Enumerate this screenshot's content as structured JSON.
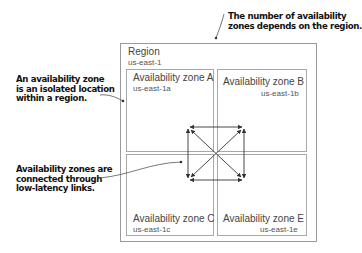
{
  "callouts": {
    "top_right": {
      "lines": [
        "The number of availability",
        "zones depends on the region."
      ]
    },
    "left_top": {
      "lines": [
        "An availability zone",
        "is an isolated location",
        "within a region."
      ]
    },
    "left_bottom": {
      "lines": [
        "Availability zones are",
        "connected through",
        "low-latency links."
      ]
    }
  },
  "region": {
    "title": "Region",
    "id": "us-east-1"
  },
  "zones": [
    {
      "title": "Availability zone A",
      "id": "us-east-1a",
      "position": "top-left"
    },
    {
      "title": "Availability zone B",
      "id": "us-east-1b",
      "position": "top-right"
    },
    {
      "title": "Availability zone C",
      "id": "us-east-1c",
      "position": "bottom-left"
    },
    {
      "title": "Availability zone E",
      "id": "us-east-1e",
      "position": "bottom-right"
    }
  ],
  "links": {
    "description": "Bidirectional low-latency links connecting every pair of availability zones",
    "pairs": [
      [
        "A",
        "B"
      ],
      [
        "A",
        "C"
      ],
      [
        "B",
        "E"
      ],
      [
        "C",
        "E"
      ],
      [
        "A",
        "E"
      ],
      [
        "B",
        "C"
      ]
    ]
  },
  "colors": {
    "box_border": "#9a9a9a",
    "text": "#444444",
    "callout_text": "#111111",
    "arrow": "#333333"
  }
}
